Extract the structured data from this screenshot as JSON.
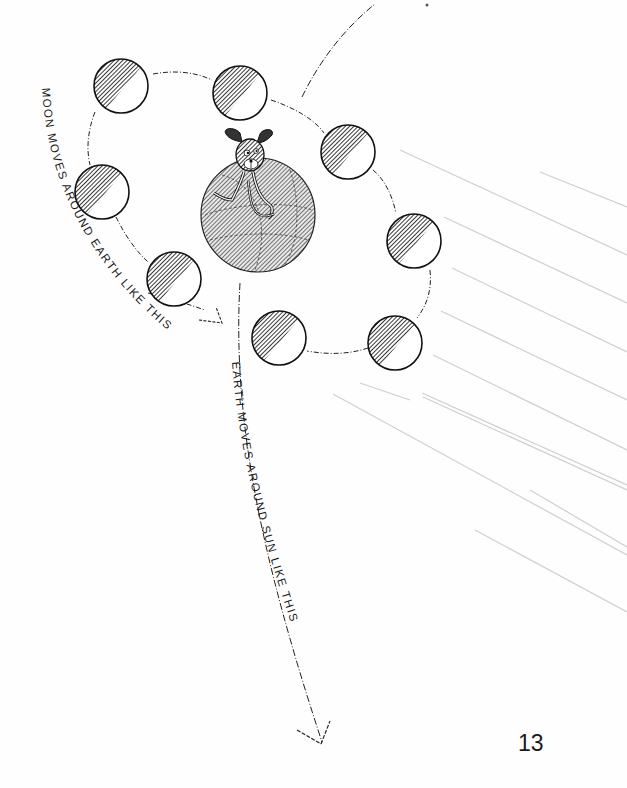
{
  "page": {
    "number": "13",
    "background_color": "#fefefe",
    "ink_color": "#1a1a1a"
  },
  "labels": {
    "moon_orbit": "MOON  MOVES  AROUND  EARTH  LIKE  THIS",
    "earth_orbit": "EARTH  MOVES  AROUND  SUN  LIKE  THIS"
  },
  "figures": {
    "earth": {
      "name": "earth-globe",
      "cx": 258,
      "cy": 215,
      "r": 57,
      "fill": "#8a8a8a"
    },
    "character": {
      "name": "dog-character",
      "description": "cartoon dog sitting on top of earth"
    },
    "moons": [
      {
        "cx": 121,
        "cy": 86,
        "r": 27
      },
      {
        "cx": 240,
        "cy": 93,
        "r": 27
      },
      {
        "cx": 348,
        "cy": 152,
        "r": 27
      },
      {
        "cx": 414,
        "cy": 241,
        "r": 27
      },
      {
        "cx": 395,
        "cy": 343,
        "r": 27
      },
      {
        "cx": 279,
        "cy": 338,
        "r": 27
      },
      {
        "cx": 174,
        "cy": 279,
        "r": 27
      },
      {
        "cx": 102,
        "cy": 192,
        "r": 27
      }
    ],
    "sun_rays": {
      "color": "#c8c8c8",
      "count": 12
    }
  }
}
